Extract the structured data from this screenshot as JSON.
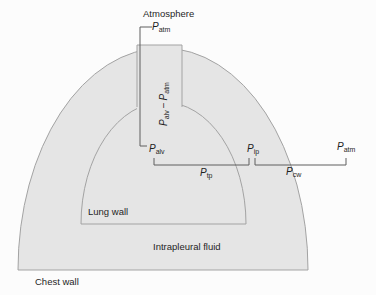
{
  "figure": {
    "type": "labeled-anatomy-pressure-diagram"
  },
  "colors": {
    "background": "#fcfcfc",
    "region_fill": "#e5e5e5",
    "region_stroke": "#a3a3a3",
    "measure_line": "#5f5f5f",
    "text": "#1f1f1f"
  },
  "labels": {
    "atmosphere": "Atmosphere",
    "p_atm_top": {
      "p": "P",
      "sub": "atm"
    },
    "p_alv_minus_p_atm": {
      "p1": "P",
      "sub1": "alv",
      "minus": "−",
      "p2": "P",
      "sub2": "atm"
    },
    "p_alv": {
      "p": "P",
      "sub": "alv"
    },
    "p_tp": {
      "p": "P",
      "sub": "tp"
    },
    "p_ip": {
      "p": "P",
      "sub": "ip"
    },
    "p_atm_right": {
      "p": "P",
      "sub": "atm"
    },
    "p_cw": {
      "p": "P",
      "sub": "cw"
    },
    "lung_wall": "Lung wall",
    "intrapleural_fluid": "Intrapleural fluid",
    "chest_wall": "Chest wall"
  }
}
